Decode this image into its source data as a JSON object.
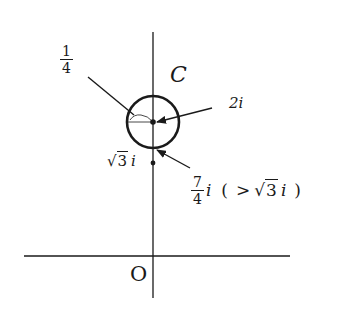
{
  "diagram": {
    "type": "complex-plane-figure",
    "origin_label": "O",
    "circle": {
      "label": "C",
      "center_label": "2i",
      "radius_label": {
        "numerator": "1",
        "denominator": "4"
      },
      "lowest_point_label": {
        "numerator": "7",
        "denominator": "4",
        "suffix": "i",
        "comparison": "( > √3 i )",
        "comparison_parts": {
          "open": "(",
          "op": ">",
          "sqrt_symbol": "√",
          "radicand": "3",
          "unit": "i",
          "close": ")"
        }
      }
    },
    "point_sqrt3": {
      "sqrt_symbol": "√",
      "radicand": "3",
      "unit": "i"
    },
    "colors": {
      "ink": "#1a1a1a",
      "background": "#ffffff"
    }
  }
}
